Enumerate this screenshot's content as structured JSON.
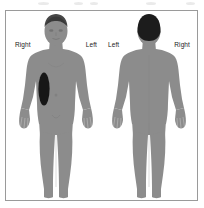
{
  "diagram": {
    "type": "body-chart",
    "view_count": 2,
    "colors": {
      "body_fill": "#8c8c8c",
      "body_outline": "#6f6f6f",
      "hair_dark": "#1c1c1c",
      "lesion_fill": "#171717",
      "frame_border": "#9a9a9a",
      "background": "#ffffff",
      "label_text": "#1a1a1a"
    },
    "views": [
      {
        "id": "anterior",
        "name": "anterior-body-figure",
        "orientation": "front",
        "label_left": "Right",
        "label_right": "Left",
        "has_face": true,
        "markings": [
          {
            "id": "lesion-1",
            "shape": "ellipse",
            "region": "right-flank",
            "cx_pct": 38,
            "cy_pct": 42,
            "rx_pct": 6,
            "ry_pct": 11
          }
        ]
      },
      {
        "id": "posterior",
        "name": "posterior-body-figure",
        "orientation": "back",
        "label_left": "Left",
        "label_right": "Right",
        "has_face": false,
        "markings": []
      }
    ]
  }
}
